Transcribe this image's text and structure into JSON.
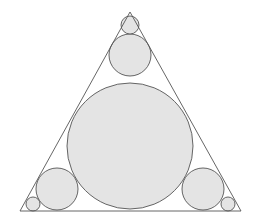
{
  "canvas": {
    "width": 254,
    "height": 223,
    "background": "#ffffff"
  },
  "style": {
    "stroke": "#555555",
    "fill": "#e4e4e4",
    "stroke_width": 0.9
  },
  "triangle": {
    "points": "130,12 20,211 241,211"
  },
  "circles": [
    {
      "name": "circle-large-center",
      "cx": 130,
      "cy": 146,
      "r": 63
    },
    {
      "name": "circle-top-medium",
      "cx": 130,
      "cy": 55,
      "r": 21
    },
    {
      "name": "circle-top-small",
      "cx": 130,
      "cy": 25,
      "r": 9
    },
    {
      "name": "circle-bottom-left-medium",
      "cx": 57,
      "cy": 189,
      "r": 21
    },
    {
      "name": "circle-bottom-left-small",
      "cx": 33,
      "cy": 204,
      "r": 7
    },
    {
      "name": "circle-bottom-right-medium",
      "cx": 203,
      "cy": 189,
      "r": 21
    },
    {
      "name": "circle-bottom-right-small",
      "cx": 228,
      "cy": 204,
      "r": 7
    }
  ]
}
